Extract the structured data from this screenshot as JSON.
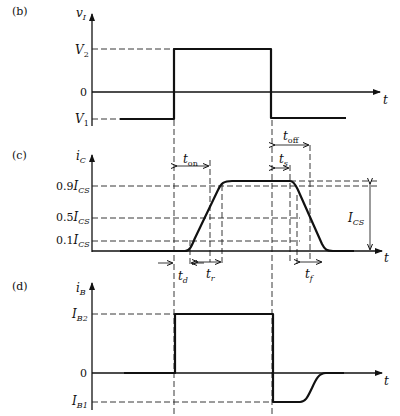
{
  "panels": {
    "b": {
      "label": "(b)",
      "y_axis": "v",
      "y_axis_sub": "I",
      "x_axis": "t",
      "levels": {
        "high": {
          "main": "V",
          "sub": "2"
        },
        "zero": "0",
        "low": {
          "main": "V",
          "sub": "1"
        }
      }
    },
    "c": {
      "label": "(c)",
      "y_axis": "i",
      "y_axis_sub": "C",
      "x_axis": "t",
      "levels": {
        "l90": {
          "prefix": "0.9",
          "main": "I",
          "sub": "CS"
        },
        "l50": {
          "prefix": "0.5",
          "main": "I",
          "sub": "CS"
        },
        "l10": {
          "prefix": "0.1",
          "main": "I",
          "sub": "CS"
        }
      },
      "amplitude": {
        "main": "I",
        "sub": "CS"
      },
      "times": {
        "t_on": {
          "main": "t",
          "sub": "on"
        },
        "t_off": {
          "main": "t",
          "sub": "off"
        },
        "t_s": {
          "main": "t",
          "sub": "s"
        },
        "t_d": {
          "main": "t",
          "sub": "d"
        },
        "t_r": {
          "main": "t",
          "sub": "r"
        },
        "t_f": {
          "main": "t",
          "sub": "f"
        }
      }
    },
    "d": {
      "label": "(d)",
      "y_axis": "i",
      "y_axis_sub": "B",
      "x_axis": "t",
      "levels": {
        "high": {
          "main": "I",
          "sub": "B2"
        },
        "zero": "0",
        "low": {
          "main": "I",
          "sub": "B1"
        }
      }
    }
  }
}
